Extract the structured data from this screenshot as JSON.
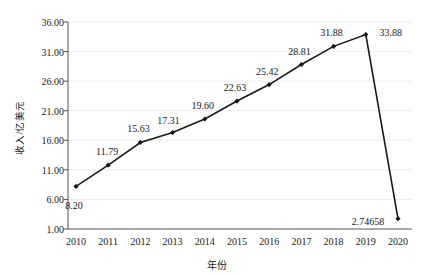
{
  "chart_data": {
    "type": "line",
    "title": "",
    "xlabel": "年份",
    "ylabel": "收入/亿美元",
    "categories": [
      "2010",
      "2011",
      "2012",
      "2013",
      "2014",
      "2015",
      "2016",
      "2017",
      "2018",
      "2019",
      "2020"
    ],
    "values": [
      8.2,
      11.79,
      15.63,
      17.31,
      19.6,
      22.63,
      25.42,
      28.81,
      31.88,
      33.88,
      2.74658
    ],
    "point_labels": [
      "8.20",
      "11.79",
      "15.63",
      "17.31",
      "19.60",
      "22.63",
      "25.42",
      "28.81",
      "31.88",
      "33.88",
      "2.74658"
    ],
    "ylim": [
      1.0,
      36.0
    ],
    "ytick_values": [
      1.0,
      6.0,
      11.0,
      16.0,
      21.0,
      26.0,
      31.0,
      36.0
    ],
    "ytick_labels": [
      "1.00",
      "6.00",
      "11.00",
      "16.00",
      "21.00",
      "26.00",
      "31.00",
      "36.00"
    ],
    "grid": true,
    "grid_axis": "y",
    "legend": false,
    "series_color": "#1a1a1a",
    "marker": "diamond",
    "grid_color": "#ededed"
  },
  "axes": {
    "y_title": "收入/亿美元",
    "x_title": "年份"
  }
}
